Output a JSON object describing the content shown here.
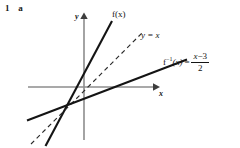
{
  "exercise": {
    "number": "1",
    "part": "a",
    "label": "1   a"
  },
  "figure": {
    "axes": {
      "color": "#8d8d8d",
      "x_axis": {
        "label": "x",
        "from_x": 28,
        "to_x": 158,
        "y": 87,
        "arrow": "right"
      },
      "y_axis": {
        "label": "y",
        "x": 84,
        "from_y": 140,
        "to_y": 14,
        "arrow": "up"
      },
      "origin": {
        "x": 84,
        "y": 87
      }
    },
    "curves": [
      {
        "name": "f",
        "label": "f(x)",
        "style": "solid",
        "color": "#141414",
        "width": 2.1,
        "description": "steep increasing line, slope about 2",
        "points": [
          {
            "x": 45,
            "y": 145
          },
          {
            "x": 112,
            "y": 22
          }
        ]
      },
      {
        "name": "identity",
        "label": "y = x",
        "style": "dashed",
        "color": "#2a2a2a",
        "width": 1.1,
        "description": "line y = x, slope 1",
        "points": [
          {
            "x": 32,
            "y": 143
          },
          {
            "x": 142,
            "y": 33
          }
        ]
      },
      {
        "name": "f-inverse",
        "label": "f^-1(x) = (x - 3) / 2",
        "style": "solid",
        "color": "#141414",
        "width": 2.1,
        "description": "shallow increasing line, slope about 0.5",
        "points": [
          {
            "x": 28,
            "y": 120
          },
          {
            "x": 186,
            "y": 60
          }
        ]
      }
    ],
    "labels": {
      "f_of_x": "f(x)",
      "y_equals_x": "y = x",
      "f_inverse_name": "f",
      "f_inverse_sup": "−1",
      "f_inverse_arg": "(x)",
      "equals": "=",
      "numerator_x": "x",
      "numerator_op": "−",
      "numerator_const": "3",
      "denominator": "2"
    }
  }
}
